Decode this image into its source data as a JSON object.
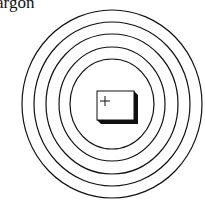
{
  "caption": "argon",
  "diagram": {
    "type": "bohr-atom-model",
    "shells": 5,
    "nucleus_symbol": "+",
    "stroke_color": "#111111",
    "background": "#ffffff"
  }
}
